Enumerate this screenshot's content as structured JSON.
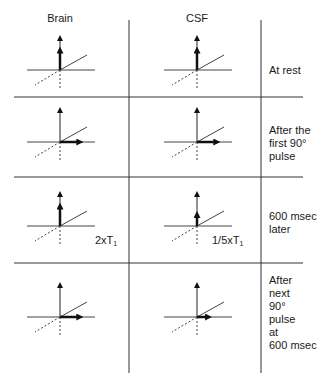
{
  "columns": [
    {
      "label": "Brain"
    },
    {
      "label": "CSF"
    }
  ],
  "rows": [
    {
      "label": "At rest",
      "brain": {
        "state": "longitudinal",
        "full_mz": true,
        "partial_mz_fraction": 0.57,
        "mxy_fraction": 0
      },
      "csf": {
        "state": "longitudinal",
        "full_mz": true,
        "partial_mz_fraction": 0.57,
        "mxy_fraction": 0
      }
    },
    {
      "label": "After the\nfirst 90°\npulse",
      "brain": {
        "state": "transverse",
        "full_mz": true,
        "partial_mz_fraction": 0,
        "mxy_fraction": 0.6
      },
      "csf": {
        "state": "transverse",
        "full_mz": true,
        "partial_mz_fraction": 0,
        "mxy_fraction": 0.6
      }
    },
    {
      "label": "600 msec\nlater",
      "brain": {
        "state": "recovered",
        "full_mz": true,
        "partial_mz_fraction": 0.57,
        "mxy_fraction": 0,
        "note": "2xT",
        "note_sub": "1"
      },
      "csf": {
        "state": "recovered",
        "full_mz": true,
        "partial_mz_fraction": 0.33,
        "mxy_fraction": 0,
        "note": "1/5xT",
        "note_sub": "1"
      }
    },
    {
      "label": "After\nnext\n90°\npulse\nat\n600 msec",
      "brain": {
        "state": "transverse",
        "full_mz": true,
        "partial_mz_fraction": 0,
        "mxy_fraction": 0.6
      },
      "csf": {
        "state": "transverse",
        "full_mz": true,
        "partial_mz_fraction": 0,
        "mxy_fraction": 0.35
      }
    }
  ],
  "colors": {
    "line": "#1a1a1a",
    "grid": "#333333"
  }
}
